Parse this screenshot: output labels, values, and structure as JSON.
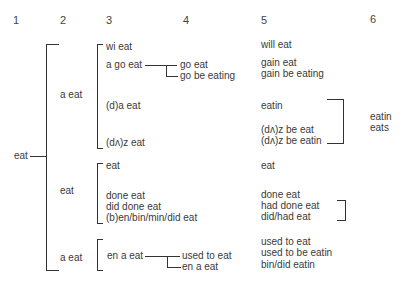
{
  "column_headers": [
    "1",
    "2",
    "3",
    "4",
    "5",
    "6"
  ],
  "root": {
    "label": "eat"
  },
  "col2": [
    {
      "label": "a eat"
    },
    {
      "label": "eat"
    },
    {
      "label": "a eat"
    }
  ],
  "col3": {
    "group1": [
      {
        "label": "wi eat"
      },
      {
        "label": "a go eat"
      },
      {
        "label": "(d)a eat"
      },
      {
        "label": "(dʌ)z eat"
      }
    ],
    "group2": [
      {
        "label": "eat"
      },
      {
        "label": "done eat"
      },
      {
        "label": "did done eat"
      },
      {
        "label": "(b)en/bin/min/did eat"
      }
    ],
    "group3": [
      {
        "label": "en a eat"
      }
    ]
  },
  "col4": {
    "go_branch": [
      {
        "label": "go eat"
      },
      {
        "label": "go be eating"
      }
    ],
    "en_branch": [
      {
        "label": "used to eat"
      },
      {
        "label": "en a eat"
      }
    ]
  },
  "col5": [
    {
      "label": "will eat"
    },
    {
      "label": "gain eat"
    },
    {
      "label": "gain be eating"
    },
    {
      "label": "eatin"
    },
    {
      "label": "(dʌ)z be eat"
    },
    {
      "label": "(dʌ)z be eatin"
    },
    {
      "label": "eat"
    },
    {
      "label": "done eat"
    },
    {
      "label": "had done eat"
    },
    {
      "label": "did/had eat"
    },
    {
      "label": "used to eat"
    },
    {
      "label": "used to be eatin"
    },
    {
      "label": "bin/did eatin"
    }
  ],
  "col6": [
    {
      "label": "eatin"
    },
    {
      "label": "eats"
    }
  ]
}
